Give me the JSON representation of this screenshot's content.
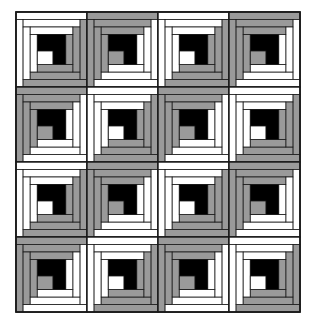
{
  "figure": {
    "name": "log-cabin-quilt-diagram",
    "canvas": {
      "width": 315,
      "height": 325
    }
  },
  "colors": {
    "light": "#ffffff",
    "dark": "#9a9a9a",
    "center": "#000000",
    "outline": "#1a1a1a",
    "background": "#ffffff"
  },
  "quilt": {
    "x": 16,
    "y": 12,
    "width": 284,
    "height": 300,
    "rows": 4,
    "columns": 4,
    "block_width": 71,
    "block_height": 75,
    "border_stroke": 1.6
  },
  "block": {
    "type": "log-cabin",
    "center_label": "chimney",
    "center_fraction": 0.2,
    "log_count": 12,
    "log_width_fraction": 0.1,
    "orientations": [
      "light-top-left",
      "dark-top-left"
    ],
    "description": "Black center square with concentric logs; one diagonal half light, other half dark"
  },
  "layout": {
    "rows": [
      {
        "index": 0,
        "blocks": [
          "light-top-left",
          "dark-top-left",
          "light-top-left",
          "dark-top-left"
        ]
      },
      {
        "index": 1,
        "blocks": [
          "dark-top-left",
          "light-top-left",
          "dark-top-left",
          "light-top-left"
        ]
      },
      {
        "index": 2,
        "blocks": [
          "light-top-left",
          "dark-top-left",
          "light-top-left",
          "dark-top-left"
        ]
      },
      {
        "index": 3,
        "blocks": [
          "dark-top-left",
          "light-top-left",
          "dark-top-left",
          "light-top-left"
        ]
      }
    ]
  }
}
